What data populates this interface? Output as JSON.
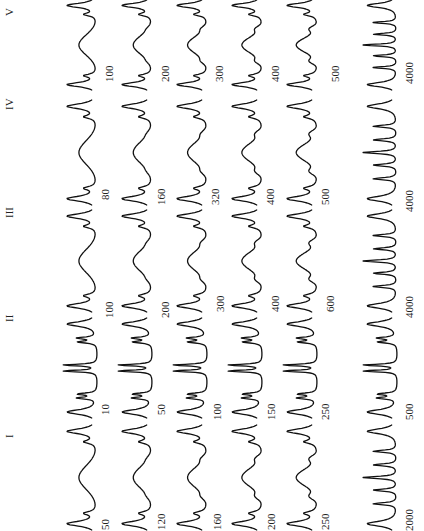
{
  "figure": {
    "orientation": "rotated 90 degrees counter-clockwise",
    "panels": [
      {
        "id": "I",
        "labels": [
          "50",
          "120",
          "160",
          "200",
          "250",
          "2000"
        ]
      },
      {
        "id": "II",
        "labels": [
          "10",
          "50",
          "100",
          "150",
          "250",
          "500"
        ]
      },
      {
        "id": "III",
        "labels": [
          "100",
          "200",
          "300",
          "400",
          "600",
          "4000"
        ]
      },
      {
        "id": "IV",
        "labels": [
          "80",
          "160",
          "320",
          "400",
          "500",
          "4000"
        ]
      },
      {
        "id": "V",
        "labels": [
          "100",
          "200",
          "300",
          "400",
          "500",
          "4000"
        ]
      }
    ],
    "caption": "faint rotated caption text along right edge (illegible)"
  },
  "chart_data": {
    "type": "line",
    "xlabel": "",
    "ylabel": "",
    "series": [
      {
        "name": "I",
        "stack_labels": [
          50,
          120,
          160,
          200,
          250,
          2000
        ]
      },
      {
        "name": "II",
        "stack_labels": [
          10,
          50,
          100,
          150,
          250,
          500
        ]
      },
      {
        "name": "III",
        "stack_labels": [
          100,
          200,
          300,
          400,
          600,
          4000
        ]
      },
      {
        "name": "IV",
        "stack_labels": [
          80,
          160,
          320,
          400,
          500,
          4000
        ]
      },
      {
        "name": "V",
        "stack_labels": [
          100,
          200,
          300,
          400,
          500,
          4000
        ]
      }
    ],
    "grid": false,
    "legend": "none"
  }
}
